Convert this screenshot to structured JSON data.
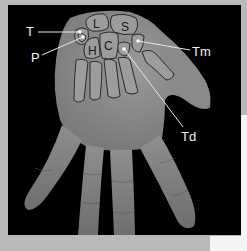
{
  "image": {
    "subject": "hand-xray-style grayscale with carpal bone annotations",
    "colors": {
      "frame": "#000000",
      "hand": "#8c8c8c",
      "outline": "#2a2a2a",
      "annotation": "#f0f0f0",
      "page_bg": "#b9b9b9"
    }
  },
  "callouts": [
    {
      "id": "T",
      "label": "T"
    },
    {
      "id": "P",
      "label": "P"
    },
    {
      "id": "Tm",
      "label": "Tm"
    },
    {
      "id": "Td",
      "label": "Td"
    }
  ],
  "bone_labels": [
    {
      "id": "L",
      "label": "L"
    },
    {
      "id": "S",
      "label": "S"
    },
    {
      "id": "H",
      "label": "H"
    },
    {
      "id": "C",
      "label": "C"
    }
  ]
}
